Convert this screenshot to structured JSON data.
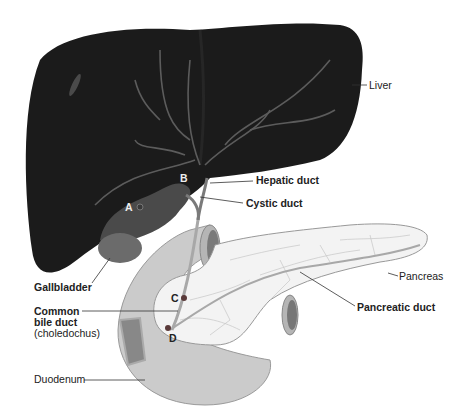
{
  "diagram": {
    "labels": {
      "liver": "Liver",
      "hepatic_duct": "Hepatic duct",
      "cystic_duct": "Cystic duct",
      "gallbladder": "Gallbladder",
      "pancreas": "Pancreas",
      "pancreatic_duct": "Pancreatic duct",
      "common_bile_duct_1": "Common",
      "common_bile_duct_2": "bile duct",
      "common_bile_duct_3": "(choledochus)",
      "duodenum": "Duodenum"
    },
    "points": {
      "a": "A",
      "b": "B",
      "c": "C",
      "d": "D"
    },
    "colors": {
      "liver": "#1a1a1a",
      "gallbladder": "#6a6a6a",
      "duodenum": "#c8c8c8",
      "pancreas": "#f2f2f2",
      "duct": "#7a7a7a",
      "point_marker": "#5a3a3a"
    }
  }
}
